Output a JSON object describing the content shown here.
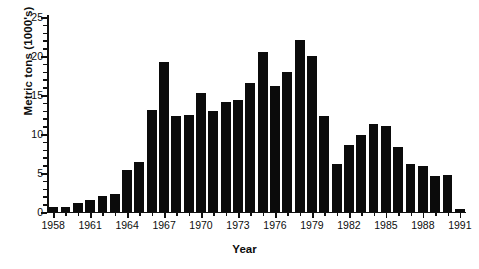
{
  "chart_data": {
    "type": "bar",
    "title": "",
    "xlabel": "Year",
    "ylabel": "Metric tons (1000's)",
    "ylim": [
      0,
      25
    ],
    "ytick_values": [
      0,
      5,
      10,
      15,
      20,
      25
    ],
    "ytick_labels": [
      "0",
      "5",
      "10",
      "15",
      "20",
      "25"
    ],
    "yminor_step": 1,
    "grid": false,
    "legend": "none",
    "bar_color": "#0b0b0b",
    "xtick_labels": [
      "1958",
      "1961",
      "1964",
      "1967",
      "1970",
      "1973",
      "1976",
      "1979",
      "1982",
      "1985",
      "1988",
      "1991"
    ],
    "xtick_label_step": 3,
    "categories": [
      "1958",
      "1959",
      "1960",
      "1961",
      "1962",
      "1963",
      "1964",
      "1965",
      "1966",
      "1967",
      "1968",
      "1969",
      "1970",
      "1971",
      "1972",
      "1973",
      "1974",
      "1975",
      "1976",
      "1977",
      "1978",
      "1979",
      "1980",
      "1981",
      "1982",
      "1983",
      "1984",
      "1985",
      "1986",
      "1987",
      "1988",
      "1989",
      "1990",
      "1991"
    ],
    "values": [
      0.7,
      0.7,
      1.2,
      1.5,
      2.0,
      2.3,
      5.4,
      6.4,
      13.1,
      19.2,
      12.3,
      12.4,
      15.2,
      12.9,
      14.1,
      14.4,
      16.6,
      20.5,
      16.2,
      17.9,
      22.0,
      20.0,
      12.3,
      6.1,
      8.6,
      9.9,
      11.3,
      11.0,
      8.3,
      6.2,
      5.9,
      4.6,
      4.7,
      0.35
    ]
  }
}
